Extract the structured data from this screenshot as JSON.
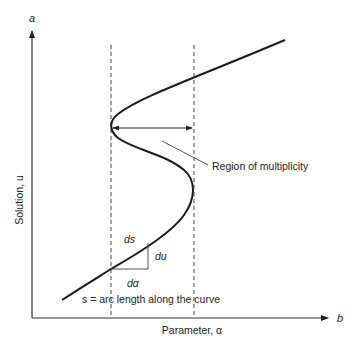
{
  "diagram": {
    "y_axis_end_label": "a",
    "x_axis_end_label": "b",
    "y_axis_title": "Solution, u",
    "x_axis_title": "Parameter, α",
    "annotation_region": "Region of multiplicity",
    "annotation_arc": "s = arc length along the curve",
    "differentials": {
      "ds": "ds",
      "du": "du",
      "dalpha": "dα"
    },
    "colors": {
      "curve": "#1a1a1a",
      "axis": "#333333",
      "dashed": "#444444",
      "text": "#222222",
      "background": "#ffffff"
    }
  }
}
